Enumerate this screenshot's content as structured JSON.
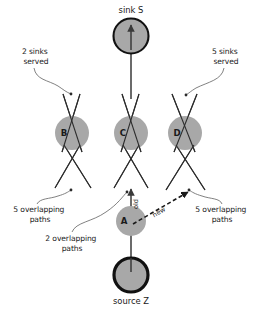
{
  "figure": {
    "background_color": "#ffffff",
    "node_fill": "#a8a8a8",
    "terminal_fill": "#a8a8a8",
    "terminal_stroke": "#111111",
    "line_color": "#2b2b2b",
    "leader_color": "#6a6a6a"
  },
  "terminals": {
    "sink": {
      "id": "S",
      "label": "sink S",
      "cx": 131,
      "cy": 36,
      "r": 17.5,
      "label_x": 131,
      "label_y": 13
    },
    "source": {
      "id": "Z",
      "label": "source Z",
      "cx": 131,
      "cy": 275,
      "r": 17,
      "label_x": 131,
      "label_y": 304
    }
  },
  "nodes": [
    {
      "id": "B",
      "label": "B",
      "cx": 72,
      "cy": 133,
      "r": 17,
      "label_x": 64,
      "label_y": 136
    },
    {
      "id": "C",
      "label": "C",
      "cx": 131,
      "cy": 133,
      "r": 17,
      "label_x": 123,
      "label_y": 136
    },
    {
      "id": "D",
      "label": "D",
      "cx": 185,
      "cy": 133,
      "r": 17,
      "label_x": 177,
      "label_y": 136
    },
    {
      "id": "A",
      "label": "A",
      "cx": 131,
      "cy": 221,
      "r": 15,
      "label_x": 124,
      "label_y": 224
    }
  ],
  "edge_tags": [
    {
      "id": "old",
      "label": "old",
      "x": 138,
      "y": 204,
      "rotation": -90
    },
    {
      "id": "new",
      "label": "new",
      "x": 160,
      "y": 214,
      "rotation": -34
    }
  ],
  "annotations": [
    {
      "id": "two-sinks-served",
      "lines": [
        "2 sinks",
        "served"
      ],
      "x": 36,
      "y": 54,
      "target_x": 71,
      "target_y": 95
    },
    {
      "id": "five-sinks-served",
      "lines": [
        "5 sinks",
        "served"
      ],
      "x": 226,
      "y": 54,
      "target_x": 186,
      "target_y": 95
    },
    {
      "id": "five-overlapping-paths-left",
      "lines": [
        "5 overlapping",
        "paths"
      ],
      "x": 40,
      "y": 212,
      "target_x": 71,
      "target_y": 190
    },
    {
      "id": "two-overlapping-paths",
      "lines": [
        "2 overlapping",
        "paths"
      ],
      "x": 72,
      "y": 241,
      "target_x": 127,
      "target_y": 192
    },
    {
      "id": "five-overlapping-paths-right",
      "lines": [
        "5 overlapping",
        "paths"
      ],
      "x": 222,
      "y": 212,
      "target_x": 189,
      "target_y": 190
    }
  ],
  "crossing_paths": [
    {
      "id": "B-upper-left",
      "x1": 63,
      "y1": 94,
      "x2": 82,
      "y2": 152
    },
    {
      "id": "B-upper-right",
      "x1": 80,
      "y1": 94,
      "x2": 62,
      "y2": 152
    },
    {
      "id": "B-lower-left",
      "x1": 55,
      "y1": 188,
      "x2": 80,
      "y2": 145
    },
    {
      "id": "B-lower-right",
      "x1": 91,
      "y1": 188,
      "x2": 64,
      "y2": 145
    },
    {
      "id": "C-upper-left",
      "x1": 122,
      "y1": 94,
      "x2": 141,
      "y2": 152
    },
    {
      "id": "C-upper-right",
      "x1": 139,
      "y1": 94,
      "x2": 121,
      "y2": 152
    },
    {
      "id": "C-lower-left",
      "x1": 114,
      "y1": 188,
      "x2": 139,
      "y2": 145
    },
    {
      "id": "C-lower-right",
      "x1": 148,
      "y1": 188,
      "x2": 123,
      "y2": 145
    },
    {
      "id": "D-upper-left",
      "x1": 172,
      "y1": 94,
      "x2": 195,
      "y2": 152
    },
    {
      "id": "D-upper-right",
      "x1": 197,
      "y1": 94,
      "x2": 174,
      "y2": 152
    },
    {
      "id": "D-lower-left",
      "x1": 166,
      "y1": 190,
      "x2": 194,
      "y2": 145
    },
    {
      "id": "D-lower-right",
      "x1": 205,
      "y1": 190,
      "x2": 176,
      "y2": 145
    }
  ],
  "flow_arrows": [
    {
      "id": "source-to-A",
      "label": "source Z to A",
      "x1": 131,
      "y1": 258,
      "x2": 131,
      "y2": 222
    },
    {
      "id": "A-to-C",
      "label": "A to C (old)",
      "x1": 131,
      "y1": 226,
      "x2": 131,
      "y2": 187
    },
    {
      "id": "C-to-sink",
      "label": "C to sink S",
      "x1": 131,
      "y1": 99,
      "x2": 131,
      "y2": 44
    }
  ],
  "new_path": {
    "id": "A-to-D-new",
    "label": "new",
    "x1": 133,
    "y1": 224,
    "x2": 188,
    "y2": 192
  }
}
